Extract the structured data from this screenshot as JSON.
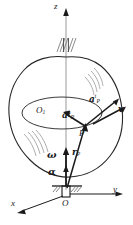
{
  "figure": {
    "background_color": "#ffffff",
    "ink_color": "#1a1a1a",
    "light_ink_color": "#8c8c8c"
  },
  "axes": {
    "z_label": "z",
    "x_label": "x",
    "y_label": "y",
    "origin_label": "O"
  },
  "points": {
    "center_label": "O",
    "center_sub": "1",
    "particle_label": "P"
  },
  "vectors": {
    "velocity": {
      "symbol": "v",
      "name": "velocity"
    },
    "normal_acceleration": {
      "symbol": "a",
      "sub": "P",
      "sup": "n",
      "name": "normal-acceleration"
    },
    "tangential_acceleration": {
      "symbol": "a",
      "sub": "P",
      "sup": "t",
      "name": "tangential-acceleration"
    },
    "position": {
      "symbol": "r",
      "sub": "P",
      "name": "position-vector"
    },
    "angular_velocity": {
      "symbol": "ω",
      "name": "angular-velocity"
    },
    "angular_acceleration": {
      "symbol": "α",
      "name": "angular-acceleration"
    }
  }
}
